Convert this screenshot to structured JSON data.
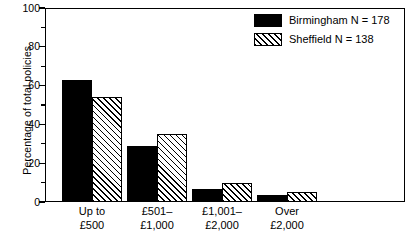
{
  "chart_data": {
    "type": "bar",
    "title": "",
    "xlabel": "",
    "ylabel": "Percentage of total policies",
    "ylim": [
      0,
      100
    ],
    "ytick_values": [
      0,
      20,
      40,
      60,
      80,
      100
    ],
    "ytick_labels": [
      "0",
      "20",
      "40",
      "60",
      "80",
      "100"
    ],
    "yminor_values": [
      10,
      30,
      50,
      70,
      90
    ],
    "grid": false,
    "legend_position": "top-right",
    "categories": [
      "Up to\n£500",
      "£501–\n£1,000",
      "£1,001–\n£2,000",
      "Over\n£2,000"
    ],
    "series": [
      {
        "name": "Birmingham N = 178",
        "short_name": "Birmingham",
        "n": 178,
        "fill": "solid-black",
        "color": "#000000",
        "values": [
          63,
          29,
          6.5,
          3.5
        ]
      },
      {
        "name": "Sheffield N = 138",
        "short_name": "Sheffield",
        "n": 138,
        "fill": "diagonal-hatch",
        "color": "#ffffff",
        "values": [
          54,
          35,
          10,
          5
        ]
      }
    ]
  },
  "legend": {
    "entries": [
      {
        "label": "Birmingham N = 178",
        "swatch": "solid-black-swatch"
      },
      {
        "label": "Sheffield N = 138",
        "swatch": "diagonal-hatch-swatch"
      }
    ]
  },
  "bleed": {
    "text": ""
  }
}
